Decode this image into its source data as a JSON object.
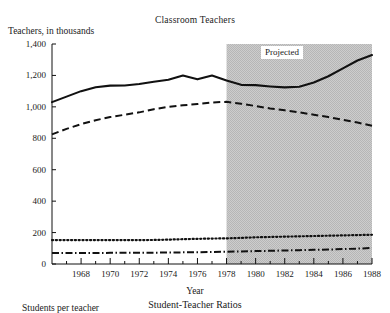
{
  "figure": {
    "title": "Classroom Teachers",
    "ylabel": "Teachers, in thousands",
    "xlabel": "Year",
    "projected_label": "Projected",
    "next_chart_title": "Student-Teacher Ratios",
    "next_chart_ylabel": "Students per teacher"
  },
  "chart_data": {
    "type": "line",
    "title": "Classroom Teachers",
    "xlabel": "Year",
    "ylabel": "Teachers, in thousands",
    "xlim": [
      1966,
      1988
    ],
    "ylim": [
      0,
      1400
    ],
    "yticks": [
      0,
      200,
      400,
      600,
      800,
      1000,
      1200,
      1400
    ],
    "ytick_labels": [
      "0",
      "200",
      "400",
      "600",
      "800",
      "1,000",
      "1,200",
      "1,400"
    ],
    "xticks": [
      1968,
      1970,
      1972,
      1974,
      1976,
      1978,
      1980,
      1982,
      1984,
      1986,
      1988
    ],
    "xtick_labels": [
      "1968",
      "1970",
      "1972",
      "1974",
      "1976",
      "1978",
      "1980",
      "1982",
      "1984",
      "1986",
      "1988"
    ],
    "xticks_minor": [
      1967,
      1969,
      1971,
      1973,
      1975,
      1977,
      1979,
      1981,
      1983,
      1985,
      1987
    ],
    "grid": false,
    "legend": "none",
    "shaded_region": {
      "label": "Projected",
      "x_start": 1978,
      "x_end": 1988,
      "color": "#c0c0c0"
    },
    "x": [
      1966,
      1967,
      1968,
      1969,
      1970,
      1971,
      1972,
      1973,
      1974,
      1975,
      1976,
      1977,
      1978,
      1979,
      1980,
      1981,
      1982,
      1983,
      1984,
      1985,
      1986,
      1987,
      1988
    ],
    "series": [
      {
        "name": "Total",
        "style": "solid",
        "values": [
          1030,
          1065,
          1100,
          1125,
          1135,
          1136,
          1145,
          1160,
          1172,
          1200,
          1175,
          1200,
          1168,
          1140,
          1138,
          1130,
          1124,
          1128,
          1155,
          1195,
          1245,
          1295,
          1330
        ]
      },
      {
        "name": "Public elementary and secondary",
        "style": "dashed",
        "values": [
          825,
          860,
          890,
          915,
          935,
          950,
          965,
          985,
          1000,
          1010,
          1018,
          1028,
          1032,
          1020,
          1005,
          990,
          978,
          965,
          950,
          935,
          918,
          900,
          880
        ]
      },
      {
        "name": "Higher education",
        "style": "dotted",
        "values": [
          152,
          152,
          152,
          152,
          152,
          152,
          152,
          153,
          155,
          158,
          160,
          162,
          163,
          166,
          170,
          172,
          174,
          176,
          178,
          180,
          182,
          184,
          186
        ]
      },
      {
        "name": "Private",
        "style": "dashdot",
        "values": [
          70,
          70,
          70,
          70,
          71,
          71,
          72,
          72,
          73,
          74,
          75,
          76,
          78,
          80,
          82,
          84,
          86,
          88,
          90,
          92,
          95,
          98,
          102
        ]
      }
    ]
  }
}
